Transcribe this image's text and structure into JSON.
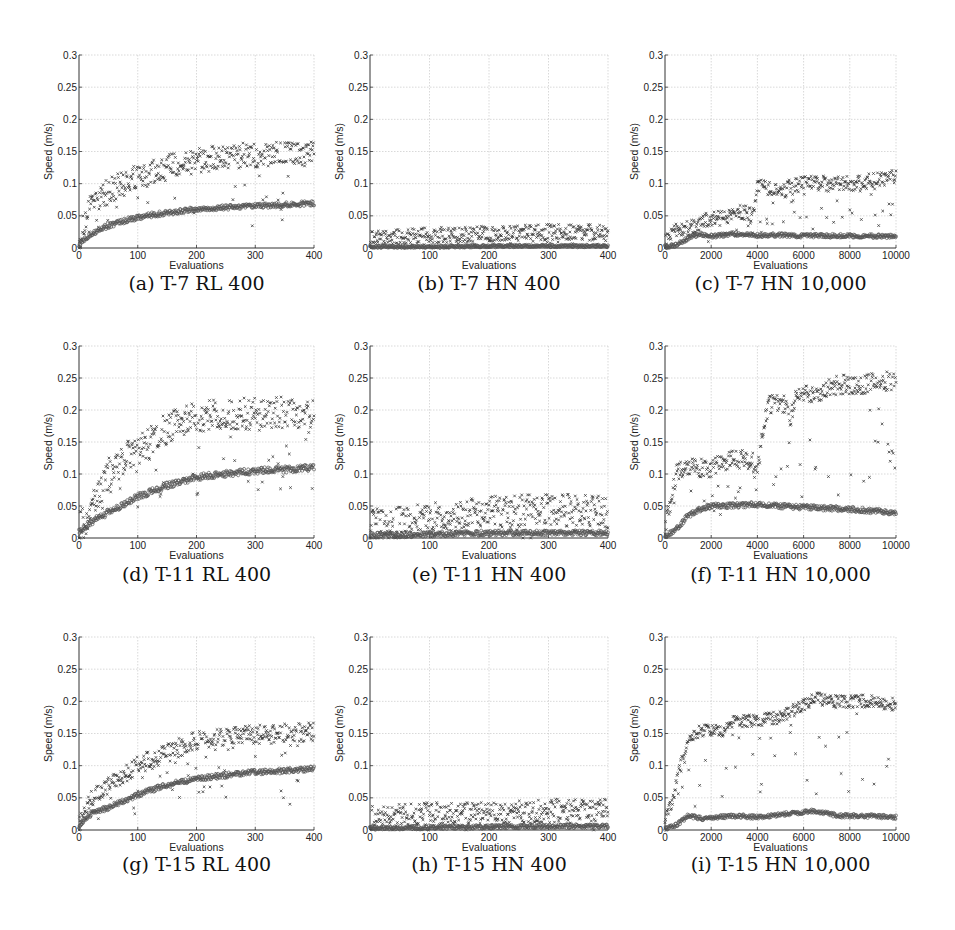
{
  "figure": {
    "caption_font_note": "subcaptions under each panel",
    "panels": [
      {
        "id": "a",
        "caption": "(a) T-7 RL 400"
      },
      {
        "id": "b",
        "caption": "(b) T-7 HN 400"
      },
      {
        "id": "c",
        "caption": "(c) T-7 HN 10,000"
      },
      {
        "id": "d",
        "caption": "(d) T-11 RL 400"
      },
      {
        "id": "e",
        "caption": "(e) T-11 HN 400"
      },
      {
        "id": "f",
        "caption": "(f) T-11 HN 10,000"
      },
      {
        "id": "g",
        "caption": "(g) T-15 RL 400"
      },
      {
        "id": "h",
        "caption": "(h) T-15 HN 400"
      },
      {
        "id": "i",
        "caption": "(i) T-15 HN 10,000"
      }
    ]
  },
  "chart_data": [
    {
      "id": "a",
      "type": "scatter",
      "title": "(a) T-7 RL 400",
      "xlabel": "Evaluations",
      "ylabel": "Speed (m/s)",
      "xlim": [
        0,
        400
      ],
      "ylim": [
        0,
        0.3
      ],
      "xticks": [
        0,
        100,
        200,
        300,
        400
      ],
      "yticks": [
        0,
        0.05,
        0.1,
        0.15,
        0.2,
        0.25,
        0.3
      ],
      "grid": true,
      "series": [
        {
          "name": "best",
          "marker": "x",
          "x": [
            0,
            20,
            50,
            100,
            150,
            200,
            250,
            300,
            350,
            400
          ],
          "values": [
            0.01,
            0.07,
            0.09,
            0.11,
            0.125,
            0.135,
            0.142,
            0.145,
            0.145,
            0.145
          ],
          "spread": 0.02
        },
        {
          "name": "mean",
          "marker": "o",
          "x": [
            0,
            20,
            50,
            100,
            150,
            200,
            250,
            300,
            350,
            400
          ],
          "values": [
            0.005,
            0.022,
            0.035,
            0.048,
            0.055,
            0.06,
            0.063,
            0.065,
            0.067,
            0.07
          ],
          "spread": 0.004
        }
      ]
    },
    {
      "id": "b",
      "type": "scatter",
      "title": "(b) T-7 HN 400",
      "xlabel": "Evaluations",
      "ylabel": "Speed (m/s)",
      "xlim": [
        0,
        400
      ],
      "ylim": [
        0,
        0.3
      ],
      "xticks": [
        0,
        100,
        200,
        300,
        400
      ],
      "yticks": [
        0,
        0.05,
        0.1,
        0.15,
        0.2,
        0.25,
        0.3
      ],
      "grid": true,
      "series": [
        {
          "name": "best",
          "marker": "x",
          "x": [
            0,
            100,
            200,
            300,
            400
          ],
          "values": [
            0.015,
            0.02,
            0.022,
            0.025,
            0.025
          ],
          "spread": 0.012
        },
        {
          "name": "mean",
          "marker": "o",
          "x": [
            0,
            100,
            200,
            300,
            400
          ],
          "values": [
            0.002,
            0.002,
            0.003,
            0.003,
            0.003
          ],
          "spread": 0.002
        }
      ]
    },
    {
      "id": "c",
      "type": "scatter",
      "title": "(c) T-7 HN 10,000",
      "xlabel": "Evaluations",
      "ylabel": "Speed (m/s)",
      "xlim": [
        0,
        10000
      ],
      "ylim": [
        0,
        0.3
      ],
      "xticks": [
        0,
        2000,
        4000,
        6000,
        8000,
        10000
      ],
      "yticks": [
        0,
        0.05,
        0.1,
        0.15,
        0.2,
        0.25,
        0.3
      ],
      "grid": true,
      "series": [
        {
          "name": "best",
          "marker": "x",
          "x": [
            0,
            500,
            1000,
            1500,
            2000,
            2500,
            3000,
            3500,
            3800,
            4000,
            5000,
            6000,
            7000,
            8000,
            9000,
            10000
          ],
          "values": [
            0.01,
            0.03,
            0.03,
            0.04,
            0.045,
            0.047,
            0.05,
            0.06,
            0.045,
            0.095,
            0.09,
            0.1,
            0.1,
            0.1,
            0.105,
            0.11
          ],
          "spread": 0.012
        },
        {
          "name": "mean",
          "marker": "o",
          "x": [
            0,
            500,
            1000,
            1500,
            2000,
            3000,
            4000,
            5000,
            6000,
            8000,
            10000
          ],
          "values": [
            0.002,
            0.005,
            0.015,
            0.022,
            0.018,
            0.022,
            0.02,
            0.02,
            0.019,
            0.019,
            0.018
          ],
          "spread": 0.003
        }
      ]
    },
    {
      "id": "d",
      "type": "scatter",
      "title": "(d) T-11 RL 400",
      "xlabel": "Evaluations",
      "ylabel": "Speed (m/s)",
      "xlim": [
        0,
        400
      ],
      "ylim": [
        0,
        0.3
      ],
      "xticks": [
        0,
        100,
        200,
        300,
        400
      ],
      "yticks": [
        0,
        0.05,
        0.1,
        0.15,
        0.2,
        0.25,
        0.3
      ],
      "grid": true,
      "series": [
        {
          "name": "best",
          "marker": "x",
          "x": [
            0,
            20,
            50,
            100,
            150,
            200,
            250,
            300,
            350,
            400
          ],
          "values": [
            0.015,
            0.04,
            0.1,
            0.14,
            0.17,
            0.19,
            0.192,
            0.195,
            0.196,
            0.197
          ],
          "spread": 0.025
        },
        {
          "name": "mean",
          "marker": "o",
          "x": [
            0,
            20,
            50,
            100,
            150,
            200,
            250,
            300,
            350,
            400
          ],
          "values": [
            0.01,
            0.025,
            0.04,
            0.065,
            0.082,
            0.095,
            0.1,
            0.105,
            0.107,
            0.11
          ],
          "spread": 0.005
        }
      ]
    },
    {
      "id": "e",
      "type": "scatter",
      "title": "(e) T-11 HN 400",
      "xlabel": "Evaluations",
      "ylabel": "Speed (m/s)",
      "xlim": [
        0,
        400
      ],
      "ylim": [
        0,
        0.3
      ],
      "xticks": [
        0,
        100,
        200,
        300,
        400
      ],
      "yticks": [
        0,
        0.05,
        0.1,
        0.15,
        0.2,
        0.25,
        0.3
      ],
      "grid": true,
      "series": [
        {
          "name": "best",
          "marker": "x",
          "x": [
            0,
            100,
            200,
            300,
            400
          ],
          "values": [
            0.02,
            0.03,
            0.04,
            0.045,
            0.04
          ],
          "spread": 0.025
        },
        {
          "name": "mean",
          "marker": "o",
          "x": [
            0,
            100,
            200,
            300,
            400
          ],
          "values": [
            0.004,
            0.006,
            0.008,
            0.008,
            0.008
          ],
          "spread": 0.004
        }
      ]
    },
    {
      "id": "f",
      "type": "scatter",
      "title": "(f) T-11 HN 10,000",
      "xlabel": "Evaluations",
      "ylabel": "Speed (m/s)",
      "xlim": [
        0,
        10000
      ],
      "ylim": [
        0,
        0.3
      ],
      "xticks": [
        0,
        2000,
        4000,
        6000,
        8000,
        10000
      ],
      "yticks": [
        0,
        0.05,
        0.1,
        0.15,
        0.2,
        0.25,
        0.3
      ],
      "grid": true,
      "series": [
        {
          "name": "best",
          "marker": "x",
          "x": [
            0,
            500,
            1000,
            2000,
            3000,
            3800,
            3950,
            4200,
            4500,
            5200,
            5400,
            5700,
            6500,
            7500,
            8500,
            9500,
            10000
          ],
          "values": [
            0.02,
            0.1,
            0.11,
            0.11,
            0.125,
            0.12,
            0.09,
            0.16,
            0.21,
            0.21,
            0.185,
            0.225,
            0.225,
            0.24,
            0.24,
            0.245,
            0.245
          ],
          "spread": 0.015
        },
        {
          "name": "mean",
          "marker": "o",
          "x": [
            0,
            500,
            1000,
            1500,
            2000,
            4000,
            5000,
            6000,
            8000,
            10000
          ],
          "values": [
            0.002,
            0.015,
            0.035,
            0.045,
            0.05,
            0.052,
            0.05,
            0.048,
            0.045,
            0.04
          ],
          "spread": 0.004
        }
      ]
    },
    {
      "id": "g",
      "type": "scatter",
      "title": "(g) T-15 RL 400",
      "xlabel": "Evaluations",
      "ylabel": "Speed (m/s)",
      "xlim": [
        0,
        400
      ],
      "ylim": [
        0,
        0.3
      ],
      "xticks": [
        0,
        100,
        200,
        300,
        400
      ],
      "yticks": [
        0,
        0.05,
        0.1,
        0.15,
        0.2,
        0.25,
        0.3
      ],
      "grid": true,
      "series": [
        {
          "name": "best",
          "marker": "x",
          "x": [
            0,
            20,
            50,
            100,
            150,
            200,
            250,
            300,
            350,
            400
          ],
          "values": [
            0.01,
            0.05,
            0.07,
            0.1,
            0.12,
            0.14,
            0.145,
            0.148,
            0.15,
            0.152
          ],
          "spread": 0.015
        },
        {
          "name": "mean",
          "marker": "o",
          "x": [
            0,
            20,
            50,
            100,
            150,
            200,
            250,
            300,
            350,
            400
          ],
          "values": [
            0.005,
            0.025,
            0.035,
            0.055,
            0.07,
            0.08,
            0.085,
            0.09,
            0.092,
            0.095
          ],
          "spread": 0.004
        }
      ]
    },
    {
      "id": "h",
      "type": "scatter",
      "title": "(h) T-15 HN 400",
      "xlabel": "Evaluations",
      "ylabel": "Speed (m/s)",
      "xlim": [
        0,
        400
      ],
      "ylim": [
        0,
        0.3
      ],
      "xticks": [
        0,
        100,
        200,
        300,
        400
      ],
      "yticks": [
        0,
        0.05,
        0.1,
        0.15,
        0.2,
        0.25,
        0.3
      ],
      "grid": true,
      "series": [
        {
          "name": "best",
          "marker": "x",
          "x": [
            0,
            100,
            200,
            300,
            400
          ],
          "values": [
            0.02,
            0.025,
            0.025,
            0.03,
            0.03
          ],
          "spread": 0.018
        },
        {
          "name": "mean",
          "marker": "o",
          "x": [
            0,
            100,
            200,
            300,
            400
          ],
          "values": [
            0.003,
            0.004,
            0.005,
            0.006,
            0.006
          ],
          "spread": 0.003
        }
      ]
    },
    {
      "id": "i",
      "type": "scatter",
      "title": "(i) T-15 HN 10,000",
      "xlabel": "Evaluations",
      "ylabel": "Speed (m/s)",
      "xlim": [
        0,
        10000
      ],
      "ylim": [
        0,
        0.3
      ],
      "xticks": [
        0,
        2000,
        4000,
        6000,
        8000,
        10000
      ],
      "yticks": [
        0,
        0.05,
        0.1,
        0.15,
        0.2,
        0.25,
        0.3
      ],
      "grid": true,
      "series": [
        {
          "name": "best",
          "marker": "x",
          "x": [
            0,
            300,
            600,
            1000,
            1500,
            2000,
            2500,
            3000,
            4000,
            5000,
            6000,
            6500,
            7000,
            8000,
            9000,
            10000
          ],
          "values": [
            0.02,
            0.04,
            0.09,
            0.14,
            0.155,
            0.155,
            0.15,
            0.17,
            0.17,
            0.175,
            0.195,
            0.205,
            0.2,
            0.2,
            0.2,
            0.195
          ],
          "spread": 0.01
        },
        {
          "name": "mean",
          "marker": "o",
          "x": [
            0,
            500,
            1000,
            1500,
            3000,
            4000,
            5000,
            6000,
            6500,
            7500,
            8500,
            10000
          ],
          "values": [
            0.002,
            0.008,
            0.022,
            0.018,
            0.022,
            0.02,
            0.024,
            0.028,
            0.03,
            0.022,
            0.022,
            0.02
          ],
          "spread": 0.003
        }
      ]
    }
  ],
  "layout": {
    "cols_x": [
      [
        79,
        314
      ],
      [
        370,
        608
      ],
      [
        665,
        896
      ]
    ],
    "rows_y": [
      [
        55,
        248
      ],
      [
        346,
        538
      ],
      [
        637,
        830
      ]
    ],
    "caption_y": [
      272,
      563,
      853
    ]
  }
}
